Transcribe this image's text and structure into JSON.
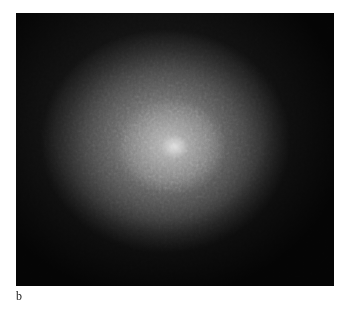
{
  "figure": {
    "panel_label": "b",
    "image_description": "grayscale micrograph with diffuse bright central spot",
    "colors": {
      "background": "#0a0a0a",
      "center": "#e8e8e8",
      "mid": "#6e6e6e"
    }
  }
}
